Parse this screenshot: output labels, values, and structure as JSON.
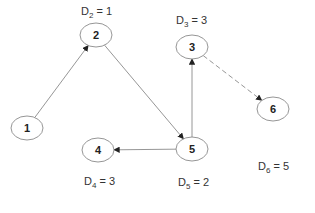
{
  "diagram": {
    "type": "directed-graph",
    "nodes": [
      {
        "id": "1",
        "label": "1",
        "distance": null
      },
      {
        "id": "2",
        "label": "2",
        "distance": {
          "var": "D",
          "sub": "2",
          "value": "1"
        }
      },
      {
        "id": "3",
        "label": "3",
        "distance": {
          "var": "D",
          "sub": "3",
          "value": "3"
        }
      },
      {
        "id": "4",
        "label": "4",
        "distance": {
          "var": "D",
          "sub": "4",
          "value": "3"
        }
      },
      {
        "id": "5",
        "label": "5",
        "distance": {
          "var": "D",
          "sub": "5",
          "value": "2"
        }
      },
      {
        "id": "6",
        "label": "6",
        "distance": {
          "var": "D",
          "sub": "6",
          "value": "5"
        }
      }
    ],
    "edges": [
      {
        "from": "1",
        "to": "2",
        "style": "solid"
      },
      {
        "from": "2",
        "to": "5",
        "style": "solid"
      },
      {
        "from": "5",
        "to": "3",
        "style": "solid"
      },
      {
        "from": "5",
        "to": "4",
        "style": "solid"
      },
      {
        "from": "3",
        "to": "6",
        "style": "dashed"
      }
    ],
    "colors": {
      "line": "#8a8a8a",
      "text": "#222222"
    }
  }
}
